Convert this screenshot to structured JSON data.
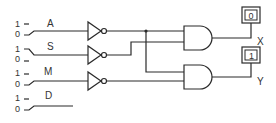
{
  "diagram": {
    "type": "logic-circuit",
    "inputs": [
      {
        "name": "A",
        "switch_high_label": "1",
        "switch_low_label": "0",
        "position": "0"
      },
      {
        "name": "S",
        "switch_high_label": "1",
        "switch_low_label": "0",
        "position": "1"
      },
      {
        "name": "M",
        "switch_high_label": "1",
        "switch_low_label": "0",
        "position": "0"
      },
      {
        "name": "D",
        "switch_high_label": "1",
        "switch_low_label": "0",
        "position": "0"
      }
    ],
    "gates": [
      {
        "id": "not-a",
        "type": "NOT",
        "input": "A"
      },
      {
        "id": "not-s",
        "type": "NOT",
        "input": "S"
      },
      {
        "id": "not-m",
        "type": "NOT",
        "input": "M"
      },
      {
        "id": "and-x",
        "type": "AND",
        "inputs": [
          "NOT A",
          "NOT S"
        ]
      },
      {
        "id": "and-y",
        "type": "AND",
        "inputs": [
          "NOT A",
          "NOT M"
        ]
      }
    ],
    "outputs": [
      {
        "name": "X",
        "display_value": "0"
      },
      {
        "name": "Y",
        "display_value": "1"
      }
    ]
  }
}
